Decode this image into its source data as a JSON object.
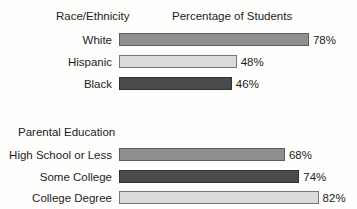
{
  "chart_data": {
    "type": "bar",
    "orientation": "horizontal",
    "value_axis_title": "Percentage of Students",
    "value_unit": "%",
    "xlim": [
      0,
      100
    ],
    "scale_px_per_percent": 2.41,
    "grid": false,
    "legend": false,
    "groups": [
      {
        "title": "Race/Ethnicity",
        "bars": [
          {
            "label": "White",
            "value": 78,
            "value_label": "78%",
            "color": "#8f8f8f",
            "border": "#5e5e5e"
          },
          {
            "label": "Hispanic",
            "value": 48,
            "value_label": "48%",
            "color": "#dbdbdb",
            "border": "#787878"
          },
          {
            "label": "Black",
            "value": 46,
            "value_label": "46%",
            "color": "#4b4b4b",
            "border": "#303030"
          }
        ]
      },
      {
        "title": "Parental Education",
        "bars": [
          {
            "label": "High School or Less",
            "value": 68,
            "value_label": "68%",
            "color": "#8f8f8f",
            "border": "#5e5e5e"
          },
          {
            "label": "Some College",
            "value": 74,
            "value_label": "74%",
            "color": "#4b4b4b",
            "border": "#303030"
          },
          {
            "label": "College Degree",
            "value": 82,
            "value_label": "82%",
            "color": "#dbdbdb",
            "border": "#787878"
          }
        ]
      }
    ]
  }
}
